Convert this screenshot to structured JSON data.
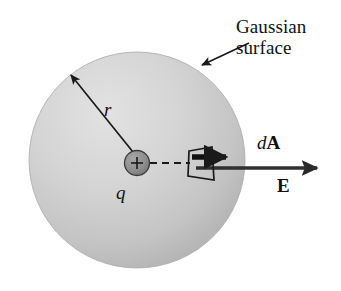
{
  "figure": {
    "background_color": "#ffffff",
    "width": 341,
    "height": 291
  },
  "labels": {
    "gaussian_surface_line1": "Gaussian",
    "gaussian_surface_line2": "surface",
    "radius": "r",
    "charge": "q",
    "area_element_d": "d",
    "area_element_A": "A",
    "field": "E",
    "charge_sign": "+"
  },
  "colors": {
    "sphere_fill_light": "#dcdcdc",
    "sphere_fill_dark": "#b4b4b4",
    "charge_fill": "#8c8c8c",
    "stroke": "#1a1a1a",
    "text": "#111111"
  },
  "geometry": {
    "sphere_center_x": 137,
    "sphere_center_y": 160,
    "sphere_radius": 108,
    "charge_center_x": 137,
    "charge_center_y": 163,
    "charge_radius": 12,
    "radius_arrow_tip_x": 70,
    "radius_arrow_tip_y": 74,
    "field_arrow_tip_x": 318,
    "field_arrow_y": 168,
    "pointer_start_x": 248,
    "pointer_start_y": 44,
    "pointer_tip_x": 200,
    "pointer_tip_y": 66
  }
}
